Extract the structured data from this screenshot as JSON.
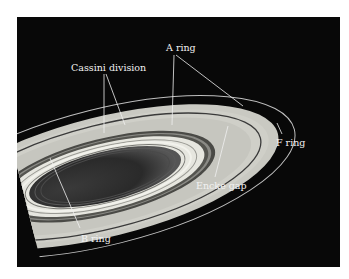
{
  "figure": {
    "labels": {
      "a_ring": "A ring",
      "cassini_division": "Cassini division",
      "f_ring": "F ring",
      "encke_gap": "Encke gap",
      "b_ring": "B ring"
    }
  },
  "colors": {
    "background": "#ffffff",
    "space": "#080808",
    "a_ring": "#c9c9c2",
    "b_ring_outer": "#e6e6df",
    "b_ring_inner": "#2e2e2e",
    "label": "#f2f2f2"
  }
}
